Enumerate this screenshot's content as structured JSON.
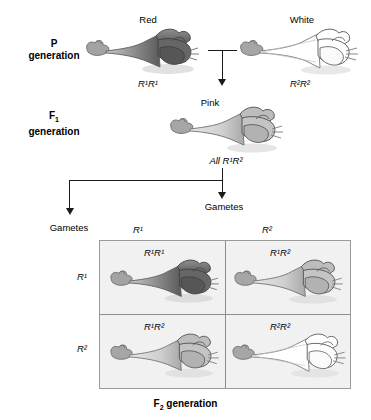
{
  "figure": {
    "generations": [
      {
        "id": "p",
        "line1": "P",
        "sub1": "",
        "line2": "generation"
      },
      {
        "id": "f1",
        "line1": "F",
        "sub1": "1",
        "line2": "generation"
      }
    ]
  },
  "p_generation": {
    "label_line1": "P",
    "label_line2": "generation",
    "parents": [
      {
        "phenotype": "Red",
        "genotype": "R¹R¹",
        "color": "#6e6e6e"
      },
      {
        "phenotype": "White",
        "genotype": "R²R²",
        "color": "#ffffff"
      }
    ]
  },
  "f1_generation": {
    "label_line1": "F",
    "label_sub": "1",
    "label_line2": "generation",
    "phenotype": "Pink",
    "genotype_text": "All R¹R²",
    "color": "#b8b8b8"
  },
  "gametes": {
    "left_label": "Gametes",
    "right_label": "Gametes"
  },
  "punnett": {
    "column_headers": [
      "R¹",
      "R²"
    ],
    "row_headers": [
      "R¹",
      "R²"
    ],
    "cells": [
      {
        "genotype": "R¹R¹",
        "phenotype": "Red",
        "color": "#6e6e6e"
      },
      {
        "genotype": "R¹R²",
        "phenotype": "Pink",
        "color": "#b8b8b8"
      },
      {
        "genotype": "R¹R²",
        "phenotype": "Pink",
        "color": "#b8b8b8"
      },
      {
        "genotype": "R²R²",
        "phenotype": "White",
        "color": "#ffffff"
      }
    ],
    "caption_line1": "F",
    "caption_sub": "2",
    "caption_line2": " generation",
    "background": "#f1f1f1",
    "border_color": "#9a9a9a"
  },
  "colors": {
    "red_flower": "#6e6e6e",
    "pink_flower": "#b8b8b8",
    "white_flower": "#ffffff",
    "stem": "#9b9b9b",
    "outline": "#555555",
    "text": "#000000",
    "arrow": "#1a1a1a"
  }
}
